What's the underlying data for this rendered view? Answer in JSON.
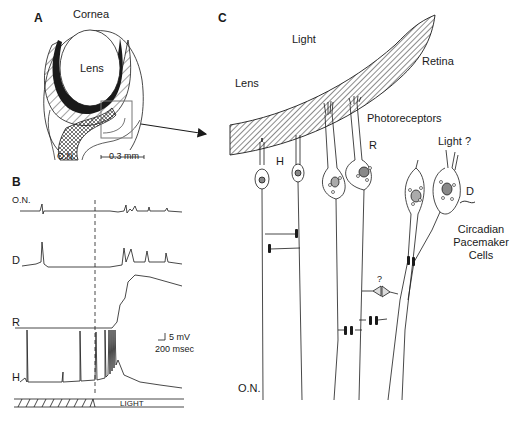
{
  "panels": {
    "a": {
      "letter": "A",
      "cornea": "Cornea",
      "lens": "Lens",
      "optic_nerve": "O.N.",
      "scale_bar": "0.3 mm"
    },
    "b": {
      "letter": "B",
      "traces": [
        "O.N.",
        "D",
        "R",
        "H"
      ],
      "scale_voltage": "5 mV",
      "scale_time": "200 msec",
      "stimulus": "LIGHT"
    },
    "c": {
      "letter": "C",
      "light": "Light",
      "lens": "Lens",
      "retina": "Retina",
      "photoreceptors": "Photoreceptors",
      "h_cell": "H",
      "r_cell": "R",
      "light_question": "Light ?",
      "d_cell": "D",
      "circadian_line1": "Circadian",
      "circadian_line2": "Pacemaker",
      "circadian_line3": "Cells",
      "unknown_synapse": "?",
      "optic_nerve": "O.N."
    }
  },
  "colors": {
    "ink": "#1a1a1a",
    "background": "#ffffff",
    "box": "#777777"
  }
}
